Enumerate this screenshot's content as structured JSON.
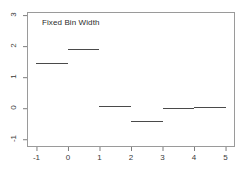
{
  "chart_data": {
    "type": "line",
    "title": "Fixed Bin Width",
    "xlabel": "",
    "ylabel": "",
    "xlim": [
      -1.3,
      5.3
    ],
    "ylim": [
      -1.25,
      3.1
    ],
    "grid": false,
    "legend": null,
    "xticks": [
      -1,
      0,
      1,
      2,
      3,
      4,
      5
    ],
    "xtick_labels": [
      "-1",
      "0",
      "1",
      "2",
      "3",
      "4",
      "5"
    ],
    "yticks": [
      -1,
      0,
      1,
      2,
      3
    ],
    "ytick_labels": [
      "-1",
      "0",
      "1",
      "2",
      "3"
    ],
    "series": [
      {
        "name": "step",
        "style": "horizontal-segments",
        "color": "#4a4a4a",
        "segments": [
          {
            "x0": -1,
            "x1": 0,
            "y": 1.45
          },
          {
            "x0": 0,
            "x1": 1,
            "y": 1.9
          },
          {
            "x0": 1,
            "x1": 2,
            "y": 0.06
          },
          {
            "x0": 2,
            "x1": 3,
            "y": -0.4
          },
          {
            "x0": 3,
            "x1": 4,
            "y": 0.02
          },
          {
            "x0": 4,
            "x1": 5,
            "y": 0.05
          }
        ]
      }
    ]
  },
  "plot": {
    "frame_color": "#9a9a9a",
    "tick_color": "#7d7d7d",
    "label_color": "#3a3a3a",
    "title_color": "#2b2b2b",
    "background": "#ffffff"
  }
}
